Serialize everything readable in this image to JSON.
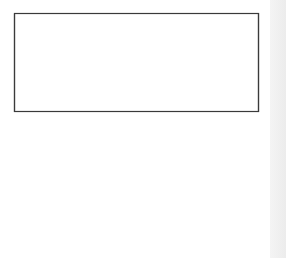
{
  "diagram": {
    "type": "optical-setup",
    "components": {
      "laser": {
        "label": "Tunablelaser"
      },
      "beamsplitter": {
        "label": "Beamsplitter"
      },
      "detector": {
        "label": "Detector"
      },
      "grating": {
        "label": "Grating"
      },
      "collimator": {
        "label": "Collimator"
      },
      "barcode": {
        "label": "Barcode"
      }
    },
    "colors": {
      "frame": "#3a3a3a",
      "box_fill": "#5a5a5a",
      "beamsplitter": "#b0b0b0",
      "grating": "#1a1a1a",
      "lens_fill": "#b8b8b8",
      "beam": "#555555",
      "barcode_bar": "#000000"
    }
  }
}
